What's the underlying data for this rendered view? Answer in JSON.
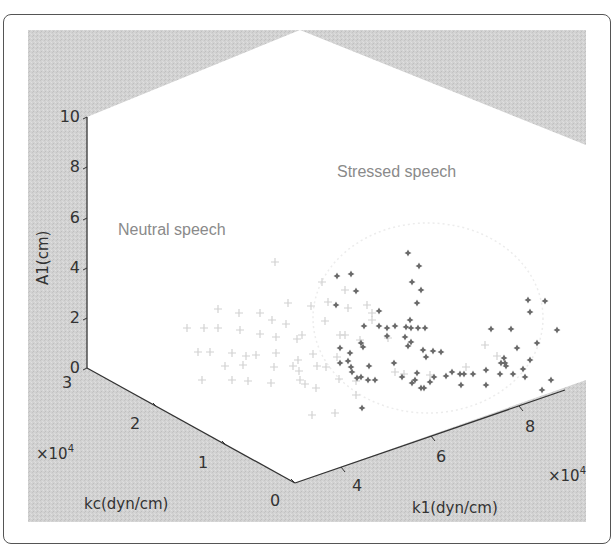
{
  "chart_data": {
    "type": "scatter",
    "projection": "3d",
    "title": "",
    "annotations": [
      "Stressed speech",
      "Neutral speech"
    ],
    "axes": {
      "z": {
        "label": "A1(cm)",
        "ticks": [
          "0",
          "2",
          "4",
          "6",
          "8",
          "10"
        ],
        "range": [
          0,
          10
        ]
      },
      "y": {
        "label": "kc(dyn/cm)",
        "ticks": [
          "0",
          "1",
          "2",
          "3"
        ],
        "range": [
          0,
          3
        ],
        "multiplier": "×10^4"
      },
      "x": {
        "label": "k1(dyn/cm)",
        "ticks": [
          "4",
          "6",
          "8"
        ],
        "range": [
          3,
          9
        ],
        "multiplier": "×10^4"
      }
    },
    "series": [
      {
        "name": "Neutral speech",
        "marker": "+",
        "color": "#d4d4d4",
        "cluster_center_k1": 3.5,
        "cluster_center_kc": 2.0,
        "cluster_center_A1": 2.0,
        "approx_count": 80
      },
      {
        "name": "Stressed speech",
        "marker": "*",
        "color": "#6b6b6b",
        "cluster_center_k1": 6.5,
        "cluster_center_kc": 1.5,
        "cluster_center_A1": 3.0,
        "approx_count": 70
      }
    ],
    "grid": false,
    "legend": "none (inline text annotations)"
  },
  "labels": {
    "z_axis": "A1(cm)",
    "y_axis": "kc(dyn/cm)",
    "x_axis": "k1(dyn/cm)",
    "multiplier_y": "×10",
    "multiplier_x": "×10",
    "exp": "4",
    "stressed": "Stressed speech",
    "neutral": "Neutral speech",
    "z_ticks": [
      "10",
      "8",
      "6",
      "4",
      "2",
      "0"
    ],
    "y_ticks": [
      "3",
      "2",
      "1",
      "0"
    ],
    "x_ticks": [
      "4",
      "6",
      "8"
    ]
  }
}
